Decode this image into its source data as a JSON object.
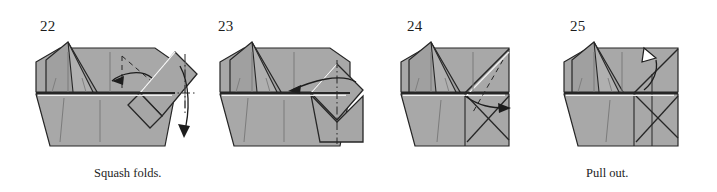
{
  "document": {
    "type": "origami-instruction-diagram",
    "background_color": "#ffffff",
    "paper_color": "#a8a8a8",
    "paper_shadow_color": "#9a9a9a",
    "outline_color": "#262626",
    "fold_line_color": "#7b7b7b",
    "highlight_color": "#f2f2f2",
    "text_color": "#1d1d1d"
  },
  "steps": [
    {
      "number": "22",
      "caption": "Squash folds.",
      "arrows": [
        "fold-arrow-left",
        "fold-arrow-down"
      ],
      "markings": [
        "valley-fold-dashed",
        "dash-dot-axis"
      ]
    },
    {
      "number": "23",
      "caption": "",
      "arrows": [
        "fold-arrow-left"
      ],
      "markings": [
        "dash-dot-axis-vertical"
      ]
    },
    {
      "number": "24",
      "caption": "",
      "arrows": [
        "fold-arrow-right"
      ],
      "markings": [
        "valley-fold-dashed",
        "dash-dot-axis-vertical"
      ]
    },
    {
      "number": "25",
      "caption": "Pull out.",
      "arrows": [
        "pull-out-hollow-arrow"
      ],
      "markings": []
    }
  ]
}
